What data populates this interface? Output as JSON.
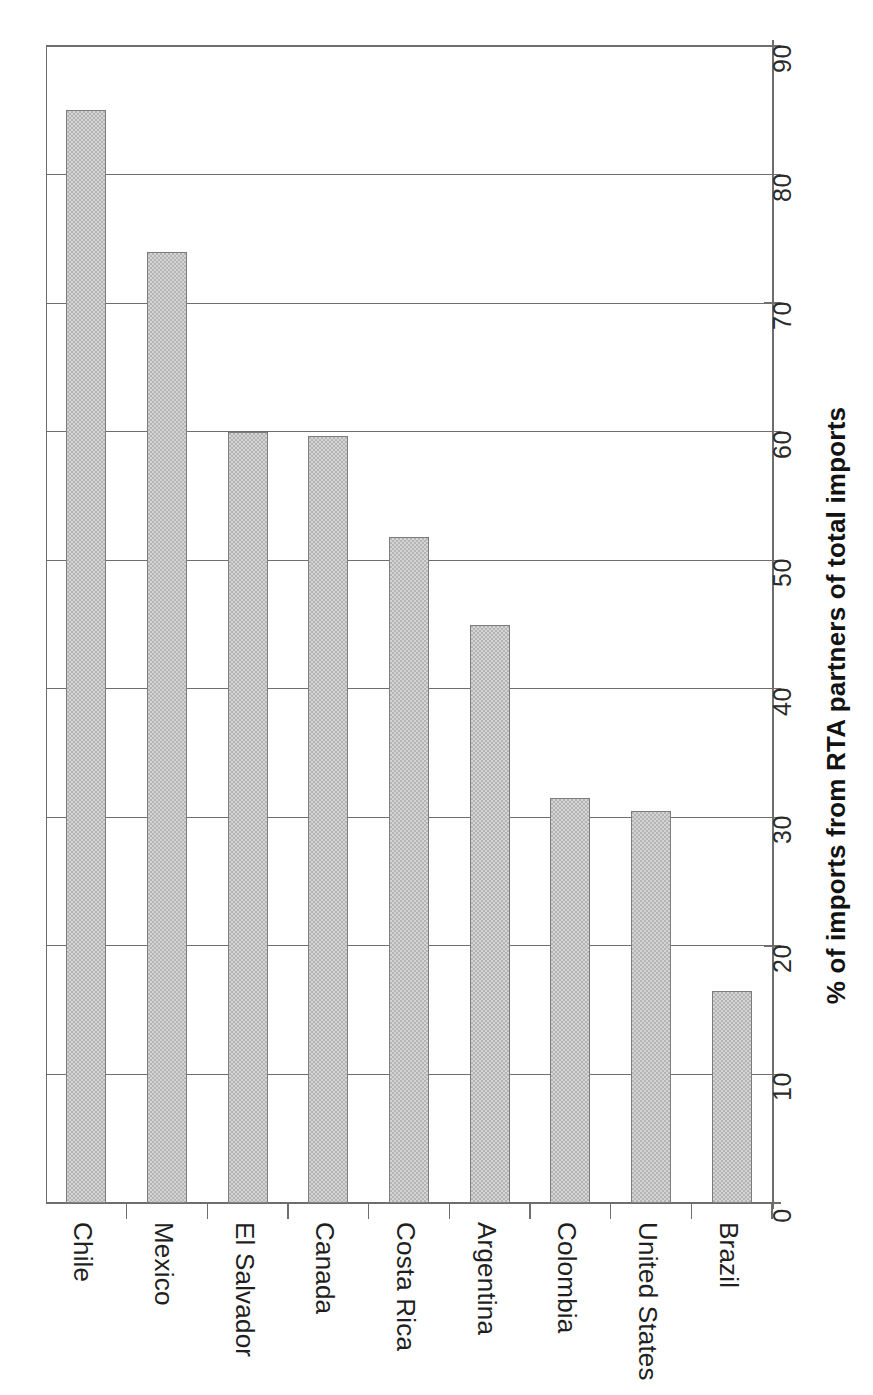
{
  "chart_data": {
    "type": "bar",
    "title": "",
    "subtitle": "",
    "orientation": "vertical-bars-rotated-labels",
    "categories": [
      "Chile",
      "Mexico",
      "El Salvador",
      "Canada",
      "Costa Rica",
      "Argentina",
      "Colombia",
      "United States",
      "Brazil"
    ],
    "values": [
      85.0,
      74.0,
      60.0,
      59.7,
      51.8,
      45.0,
      31.5,
      30.5,
      16.5
    ],
    "series": [
      {
        "name": "% of imports from RTA partners of total imports",
        "values": [
          85.0,
          74.0,
          60.0,
          59.7,
          51.8,
          45.0,
          31.5,
          30.5,
          16.5
        ]
      }
    ],
    "xlabel": "",
    "ylabel": "% of imports from RTA partners of total imports",
    "ylim": [
      0,
      90
    ],
    "ytick_values": [
      0,
      10,
      20,
      30,
      40,
      50,
      60,
      70,
      80,
      90
    ],
    "ytick_labels": [
      "0",
      "10",
      "20",
      "30",
      "40",
      "50",
      "60",
      "70",
      "80",
      "90"
    ],
    "grid": true,
    "grid_axis": "value",
    "legend": false,
    "legend_position": "none",
    "bar_fill_color": "#b5b5b5",
    "bar_border_color": "#7d7d7d",
    "axis_color": "#6e6e6e",
    "background_color": "#ffffff"
  },
  "axis": {
    "title": "% of imports from RTA partners of total imports"
  },
  "ticks": [
    {
      "label": "0",
      "value": 0
    },
    {
      "label": "10",
      "value": 10
    },
    {
      "label": "20",
      "value": 20
    },
    {
      "label": "30",
      "value": 30
    },
    {
      "label": "40",
      "value": 40
    },
    {
      "label": "50",
      "value": 50
    },
    {
      "label": "60",
      "value": 60
    },
    {
      "label": "70",
      "value": 70
    },
    {
      "label": "80",
      "value": 80
    },
    {
      "label": "90",
      "value": 90
    }
  ],
  "bars": [
    {
      "label": "Chile",
      "value": 85.0
    },
    {
      "label": "Mexico",
      "value": 74.0
    },
    {
      "label": "El Salvador",
      "value": 60.0
    },
    {
      "label": "Canada",
      "value": 59.7
    },
    {
      "label": "Costa Rica",
      "value": 51.8
    },
    {
      "label": "Argentina",
      "value": 45.0
    },
    {
      "label": "Colombia",
      "value": 31.5
    },
    {
      "label": "United States",
      "value": 30.5
    },
    {
      "label": "Brazil",
      "value": 16.5
    }
  ]
}
